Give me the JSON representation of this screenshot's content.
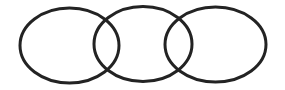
{
  "diagram": {
    "type": "overlapping-ellipses",
    "stroke_color": "#232323",
    "stroke_width": 3,
    "fill": "none",
    "shapes": [
      {
        "name": "ellipse-left",
        "cx": 69.5,
        "cy": 45.5,
        "rx": 49.5,
        "ry": 37.5
      },
      {
        "name": "ellipse-middle",
        "cx": 143,
        "cy": 44,
        "rx": 49,
        "ry": 37.5
      },
      {
        "name": "ellipse-right",
        "cx": 215.5,
        "cy": 44.5,
        "rx": 50.5,
        "ry": 37.5
      }
    ]
  }
}
